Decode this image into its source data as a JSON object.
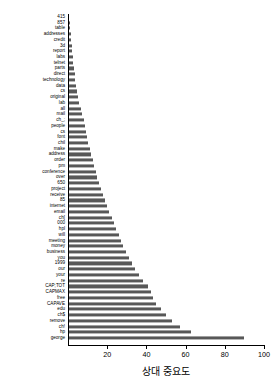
{
  "chart_data": {
    "type": "bar",
    "orientation": "horizontal",
    "title": "",
    "xlabel": "상대 중요도",
    "ylabel": "",
    "xlim": [
      0,
      100
    ],
    "ylim": null,
    "grid": false,
    "legend": null,
    "bar_color": "#585858",
    "axis_color": "#000000",
    "xticks": [
      20,
      40,
      60,
      80,
      100
    ],
    "xticklabels": [
      "20",
      "40",
      "60",
      "80",
      "100"
    ],
    "categories": [
      "415",
      "857",
      "table",
      "addresses",
      "credit",
      "3d",
      "report",
      "labs",
      "telnet",
      "parts",
      "direct",
      "technology",
      "data",
      "cs",
      "original",
      "lab",
      "all",
      "mail",
      "ch_;",
      "people",
      "cs",
      "font",
      "chil",
      "make",
      "address",
      "order",
      "pm",
      "conference",
      "over",
      "650",
      "project",
      "receive",
      "85",
      "internet",
      "email",
      "ch[",
      "000",
      "hpl",
      "will",
      "meeting",
      "money",
      "business",
      "you",
      "1999",
      "our",
      "your",
      "re",
      "CAP;TOT",
      "CAPMAX",
      "free",
      "CAPAVE",
      "edu",
      "ch$",
      "remove",
      "ch!",
      "hp",
      "george"
    ],
    "values": [
      0.6,
      0.8,
      1.2,
      1.4,
      1.6,
      1.8,
      2.0,
      2.3,
      2.6,
      3.0,
      3.4,
      3.8,
      4.2,
      4.6,
      5.2,
      5.8,
      6.5,
      7.2,
      8.0,
      8.6,
      9.2,
      9.8,
      10.4,
      11.0,
      11.8,
      12.6,
      13.4,
      14.2,
      15.0,
      15.8,
      16.8,
      17.8,
      18.8,
      19.8,
      21.0,
      22.2,
      23.4,
      24.6,
      25.8,
      27.0,
      28.2,
      29.6,
      31.0,
      32.6,
      34.4,
      36.4,
      38.4,
      40.6,
      42.6,
      43.6,
      44.8,
      47.2,
      50.0,
      53.0,
      57.0,
      63.0,
      90.0
    ]
  }
}
